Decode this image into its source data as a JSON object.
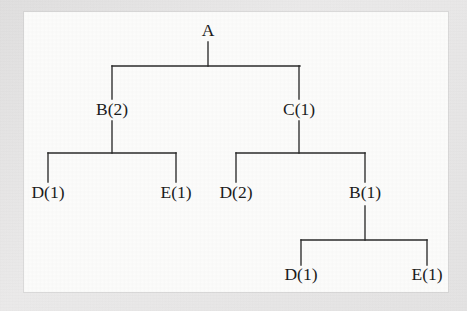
{
  "diagram": {
    "type": "tree",
    "background_color": "#fcfcfb",
    "line_color": "#2a2a2a",
    "text_color": "#1c1c1c",
    "nodes": [
      {
        "id": "root",
        "label": "A",
        "x": 208,
        "y": 36,
        "level": 0
      },
      {
        "id": "n-b2",
        "label": "B(2)",
        "x": 112,
        "y": 115,
        "level": 1
      },
      {
        "id": "n-c1",
        "label": "C(1)",
        "x": 299,
        "y": 115,
        "level": 1
      },
      {
        "id": "n-d1-a",
        "label": "D(1)",
        "x": 48,
        "y": 198,
        "level": 2
      },
      {
        "id": "n-e1-a",
        "label": "E(1)",
        "x": 176,
        "y": 198,
        "level": 2
      },
      {
        "id": "n-d2",
        "label": "D(2)",
        "x": 236,
        "y": 198,
        "level": 2
      },
      {
        "id": "n-b1",
        "label": "B(1)",
        "x": 365,
        "y": 198,
        "level": 2
      },
      {
        "id": "n-d1-b",
        "label": "D(1)",
        "x": 301,
        "y": 280,
        "level": 3
      },
      {
        "id": "n-e1-b",
        "label": "E(1)",
        "x": 427,
        "y": 280,
        "level": 3
      }
    ],
    "edges": [
      {
        "id": "edge-root-stem",
        "from": "root",
        "to": "bar-1",
        "path": "M 208 42 L 208 66"
      },
      {
        "id": "edge-bar-1",
        "from": "bar-1",
        "to": "bar-1",
        "path": "M 112 66 L 300 66"
      },
      {
        "id": "edge-bar1-b2",
        "from": "bar-1",
        "to": "n-b2",
        "path": "M 112 66 L 112 99"
      },
      {
        "id": "edge-bar1-c1",
        "from": "bar-1",
        "to": "n-c1",
        "path": "M 299 66 L 299 99"
      },
      {
        "id": "edge-b2-stem",
        "from": "n-b2",
        "to": "bar-2",
        "path": "M 112 121 L 112 153"
      },
      {
        "id": "edge-bar-2",
        "from": "bar-2",
        "to": "bar-2",
        "path": "M 48 153 L 176 153"
      },
      {
        "id": "edge-bar2-d1",
        "from": "bar-2",
        "to": "n-d1-a",
        "path": "M 48 153 L 48 182"
      },
      {
        "id": "edge-bar2-e1",
        "from": "bar-2",
        "to": "n-e1-a",
        "path": "M 176 153 L 176 182"
      },
      {
        "id": "edge-c1-stem",
        "from": "n-c1",
        "to": "bar-3",
        "path": "M 299 121 L 299 153"
      },
      {
        "id": "edge-bar-3",
        "from": "bar-3",
        "to": "bar-3",
        "path": "M 236 153 L 365 153"
      },
      {
        "id": "edge-bar3-d2",
        "from": "bar-3",
        "to": "n-d2",
        "path": "M 236 153 L 236 182"
      },
      {
        "id": "edge-bar3-b1",
        "from": "bar-3",
        "to": "n-b1",
        "path": "M 365 153 L 365 182"
      },
      {
        "id": "edge-b1-stem",
        "from": "n-b1",
        "to": "bar-4",
        "path": "M 365 206 L 365 240"
      },
      {
        "id": "edge-bar-4",
        "from": "bar-4",
        "to": "bar-4",
        "path": "M 301 240 L 427 240"
      },
      {
        "id": "edge-bar4-d1",
        "from": "bar-4",
        "to": "n-d1-b",
        "path": "M 301 240 L 301 265"
      },
      {
        "id": "edge-bar4-e1",
        "from": "bar-4",
        "to": "n-e1-b",
        "path": "M 427 240 L 427 265"
      }
    ]
  }
}
